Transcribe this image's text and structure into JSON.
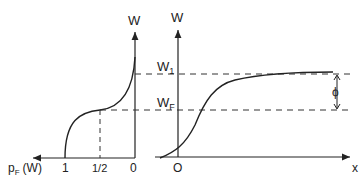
{
  "left_plot": {
    "y_axis_label": "W",
    "x_axis_label": "p",
    "x_axis_label_sub": "F",
    "x_axis_label_arg": "(W)",
    "x_ticks": [
      "1",
      "1/2",
      "0"
    ]
  },
  "right_plot": {
    "y_axis_label": "W",
    "x_axis_label": "x",
    "origin_label": "O",
    "level_w1": "W",
    "level_w1_sub": "1",
    "level_wf": "W",
    "level_wf_sub": "F",
    "gap_label": "ϕ"
  },
  "colors": {
    "line": "#222222",
    "dash": "#333333",
    "background": "#ffffff"
  }
}
